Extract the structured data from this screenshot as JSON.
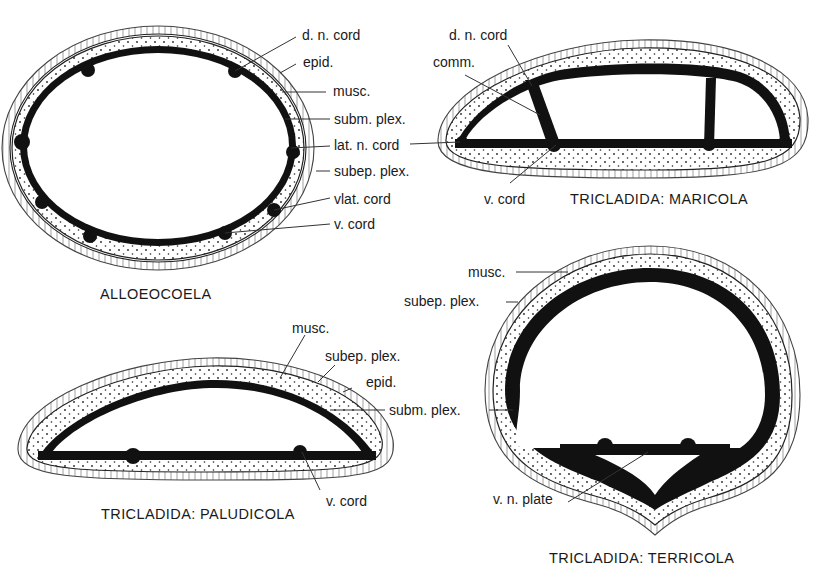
{
  "figure": {
    "panels": {
      "alloeocoela": {
        "title": "ALLOEOCOELA",
        "labels": [
          "d. n. cord",
          "epid.",
          "musc.",
          "subm. plex.",
          "lat. n. cord",
          "subep. plex.",
          "vlat. cord",
          "v. cord"
        ]
      },
      "maricola": {
        "title": "TRICLADIDA:  MARICOLA",
        "labels": [
          "d. n. cord",
          "comm.",
          "v. cord"
        ]
      },
      "paludicola": {
        "title": "TRICLADIDA:  PALUDICOLA",
        "labels": [
          "musc.",
          "subep. plex.",
          "epid.",
          "subm. plex.",
          "v. cord"
        ]
      },
      "terricola": {
        "title": "TRICLADIDA:  TERRICOLA",
        "labels": [
          "musc.",
          "subep. plex.",
          "v. n. plate"
        ]
      }
    },
    "colors": {
      "ink": "#111111",
      "background": "#ffffff"
    }
  }
}
